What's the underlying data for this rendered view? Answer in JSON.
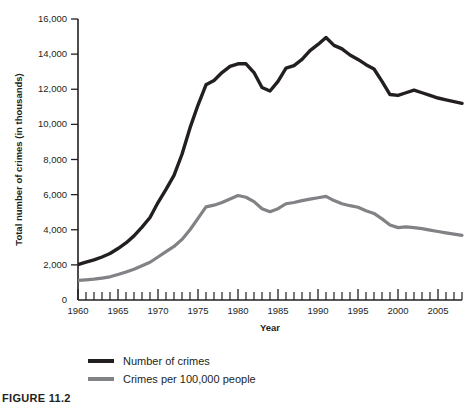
{
  "chart_data": {
    "type": "line",
    "title": "",
    "xlabel": "Year",
    "ylabel": "Total number of crimes (in thousands)",
    "xlim": [
      1960,
      2008
    ],
    "ylim": [
      0,
      16000
    ],
    "grid": false,
    "legend_position": "bottom-left",
    "x_ticks": [
      1960,
      1965,
      1970,
      1975,
      1980,
      1985,
      1990,
      1995,
      2000,
      2005
    ],
    "x_tick_labels": [
      "1960",
      "1965",
      "1970",
      "1975",
      "1980",
      "1985",
      "1990",
      "1995",
      "2000",
      "2005"
    ],
    "x_minor_tick_step": 1,
    "y_ticks": [
      0,
      2000,
      4000,
      6000,
      8000,
      10000,
      12000,
      14000,
      16000
    ],
    "y_tick_labels": [
      "0",
      "2,000",
      "4,000",
      "6,000",
      "8,000",
      "10,000",
      "12,000",
      "14,000",
      "16,000"
    ],
    "x": [
      1960,
      1961,
      1962,
      1963,
      1964,
      1965,
      1966,
      1967,
      1968,
      1969,
      1970,
      1971,
      1972,
      1973,
      1974,
      1975,
      1976,
      1977,
      1978,
      1979,
      1980,
      1981,
      1982,
      1983,
      1984,
      1985,
      1986,
      1987,
      1988,
      1989,
      1990,
      1991,
      1992,
      1993,
      1994,
      1995,
      1996,
      1997,
      1998,
      1999,
      2000,
      2001,
      2002,
      2003,
      2004,
      2005,
      2006,
      2007,
      2008
    ],
    "series": [
      {
        "name": "Number of crimes",
        "color": "#231f20",
        "width": 3.4,
        "values": [
          2020,
          2150,
          2280,
          2450,
          2650,
          2930,
          3250,
          3650,
          4150,
          4700,
          5550,
          6300,
          7100,
          8300,
          9800,
          11100,
          12250,
          12500,
          12950,
          13300,
          13450,
          13450,
          12950,
          12100,
          11900,
          12450,
          13200,
          13350,
          13700,
          14200,
          14550,
          14950,
          14500,
          14300,
          13950,
          13700,
          13400,
          13150,
          12450,
          11700,
          11650,
          11800,
          11950,
          11800,
          11650,
          11500,
          11400,
          11300,
          11200
        ]
      },
      {
        "name": "Crimes per 100,000 people",
        "color": "#808285",
        "width": 3.2,
        "values": [
          1120,
          1150,
          1190,
          1250,
          1320,
          1450,
          1590,
          1750,
          1950,
          2150,
          2450,
          2750,
          3050,
          3450,
          4000,
          4650,
          5300,
          5400,
          5550,
          5750,
          5950,
          5850,
          5600,
          5200,
          5030,
          5200,
          5480,
          5550,
          5660,
          5740,
          5820,
          5900,
          5660,
          5480,
          5370,
          5280,
          5080,
          4930,
          4620,
          4270,
          4120,
          4160,
          4120,
          4060,
          3980,
          3900,
          3820,
          3750,
          3680
        ]
      }
    ]
  },
  "legend": {
    "entries": [
      {
        "label": "Number of crimes",
        "color": "#231f20"
      },
      {
        "label": "Crimes per 100,000 people",
        "color": "#808285"
      }
    ]
  },
  "caption": {
    "text": "FIGURE 11.2"
  }
}
